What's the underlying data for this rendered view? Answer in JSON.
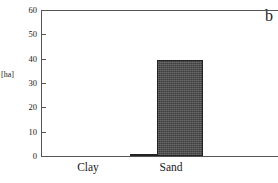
{
  "panel": {
    "label": "b"
  },
  "chart_data": {
    "type": "bar",
    "title": "",
    "xlabel": "",
    "ylabel": "[ha]",
    "ylim": [
      0,
      60
    ],
    "yticks": [
      0,
      10,
      20,
      30,
      40,
      50,
      60
    ],
    "ytick_labels": [
      "0",
      "10",
      "20",
      "30",
      "40",
      "50",
      "60"
    ],
    "grid": false,
    "legend": "none",
    "categories": [
      "Clay",
      "Sand"
    ],
    "values": [
      0,
      39.5
    ],
    "bars": [
      {
        "category": "Clay",
        "value": 0,
        "visible": false
      },
      {
        "category": "Sand",
        "value": 0.4,
        "visible": true
      },
      {
        "category": "Sand",
        "value": 39.5,
        "visible": true
      }
    ],
    "series": [
      {
        "name": "",
        "values": [
          0,
          39.5
        ]
      }
    ],
    "colors": {
      "bar_fill": "#4b4b4b",
      "bar_edge": "#232323",
      "axis": "#555555",
      "text": "#1a1a1a",
      "background": "#ffffff"
    }
  }
}
